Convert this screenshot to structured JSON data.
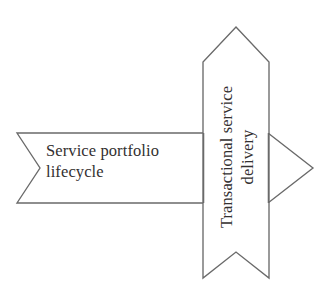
{
  "diagram": {
    "type": "process-arrow-diagram",
    "background_color": "#ffffff",
    "stroke_color": "#6a6a6a",
    "text_color": "#333030",
    "shapes": {
      "horizontal_arrow": {
        "name": "service-portfolio-lifecycle-arrow",
        "label": "Service portfolio\nlifecycle",
        "orientation": "horizontal",
        "direction": "right",
        "tail_style": "chevron-notch",
        "head_style": "chevron-point",
        "fill": "#ffffff"
      },
      "vertical_arrow": {
        "name": "transactional-service-delivery-arrow",
        "label": "Transactional service\ndelivery",
        "orientation": "vertical",
        "direction": "up",
        "tail_style": "chevron-notch",
        "head_style": "chevron-point",
        "text_rotation_degrees": -90,
        "fill": "#ffffff"
      }
    }
  }
}
